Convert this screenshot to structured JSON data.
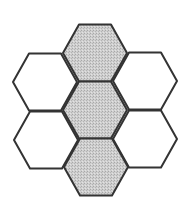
{
  "diagram": {
    "type": "hexagonal-grid",
    "colors": {
      "background": "#ffffff",
      "stroke": "#333333",
      "shaded_fill": "#c6c6c6",
      "unshaded_fill": "#ffffff"
    },
    "cells": [
      {
        "id": "top-center",
        "cx": 95,
        "cy": 53,
        "shaded": true
      },
      {
        "id": "upper-left",
        "cx": 45,
        "cy": 82,
        "shaded": false
      },
      {
        "id": "upper-right",
        "cx": 145,
        "cy": 81,
        "shaded": false
      },
      {
        "id": "middle-center",
        "cx": 95,
        "cy": 110,
        "shaded": true
      },
      {
        "id": "lower-left",
        "cx": 46,
        "cy": 140,
        "shaded": false
      },
      {
        "id": "lower-right",
        "cx": 145,
        "cy": 139,
        "shaded": false
      },
      {
        "id": "bottom-center",
        "cx": 96,
        "cy": 167,
        "shaded": true
      }
    ],
    "hex_radius": 32,
    "hex_half_height": 28.5
  }
}
